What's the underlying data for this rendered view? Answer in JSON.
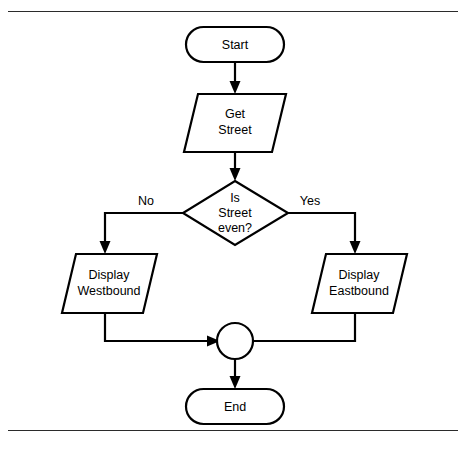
{
  "diagram": {
    "type": "flowchart",
    "colors": {
      "stroke": "#000000",
      "fill": "#ffffff",
      "background": "#ffffff",
      "rule": "#2b2b2b"
    },
    "frame": {
      "top_rule": true,
      "bottom_rule": true
    },
    "nodes": [
      {
        "id": "start",
        "shape": "terminator",
        "label": "Start",
        "lines": [
          "Start"
        ]
      },
      {
        "id": "get-street",
        "shape": "parallelogram",
        "label": "Get Street",
        "lines": [
          "Get",
          "Street"
        ]
      },
      {
        "id": "is-street-even",
        "shape": "diamond",
        "label": "Is Street even?",
        "lines": [
          "Is",
          "Street",
          "even?"
        ]
      },
      {
        "id": "display-westbound",
        "shape": "parallelogram",
        "label": "Display Westbound",
        "lines": [
          "Display",
          "Westbound"
        ]
      },
      {
        "id": "display-eastbound",
        "shape": "parallelogram",
        "label": "Display Eastbound",
        "lines": [
          "Display",
          "Eastbound"
        ]
      },
      {
        "id": "merge",
        "shape": "circle",
        "label": ""
      },
      {
        "id": "end",
        "shape": "terminator",
        "label": "End",
        "lines": [
          "End"
        ]
      }
    ],
    "edges": [
      {
        "id": "start-to-get-street",
        "from": "start",
        "to": "get-street",
        "label": ""
      },
      {
        "id": "get-street-to-decision",
        "from": "get-street",
        "to": "is-street-even",
        "label": ""
      },
      {
        "id": "decision-no",
        "from": "is-street-even",
        "to": "display-westbound",
        "label": "No"
      },
      {
        "id": "decision-yes",
        "from": "is-street-even",
        "to": "display-eastbound",
        "label": "Yes"
      },
      {
        "id": "westbound-to-merge",
        "from": "display-westbound",
        "to": "merge",
        "label": ""
      },
      {
        "id": "eastbound-to-merge",
        "from": "display-eastbound",
        "to": "merge",
        "label": ""
      },
      {
        "id": "merge-to-end",
        "from": "merge",
        "to": "end",
        "label": ""
      }
    ]
  }
}
